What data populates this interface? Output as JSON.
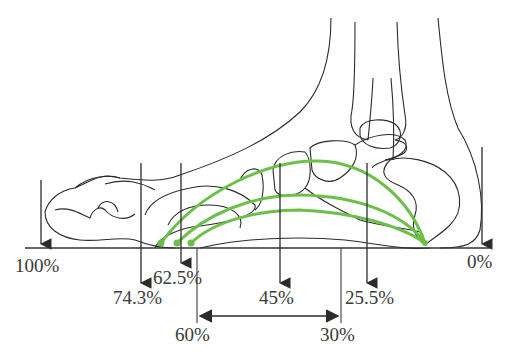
{
  "diagram": {
    "colors": {
      "outline": "#2b2b2b",
      "arch": "#6cc04a",
      "ground": "#333333",
      "text": "#3a3a3a"
    },
    "load_markers": [
      {
        "id": "toe",
        "label": "100%",
        "x": 41
      },
      {
        "id": "metatarsal-1",
        "label": "74.3%",
        "x": 141
      },
      {
        "id": "metatarsal-2",
        "label": "62.5%",
        "x": 181
      },
      {
        "id": "midfoot",
        "label": "45%",
        "x": 280
      },
      {
        "id": "hindfoot",
        "label": "25.5%",
        "x": 367
      },
      {
        "id": "heel",
        "label": "0%",
        "x": 482
      }
    ],
    "span": {
      "start_label": "60%",
      "end_label": "30%"
    },
    "arches": [
      {
        "name": "medial-arch-outer",
        "start_x": 161
      },
      {
        "name": "medial-arch-middle",
        "start_x": 177
      },
      {
        "name": "medial-arch-inner",
        "start_x": 191
      }
    ]
  }
}
